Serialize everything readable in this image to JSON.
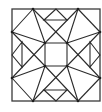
{
  "diagram": {
    "title": "",
    "stroke_color": "#2b2b2b",
    "background_color": "#ffffff",
    "frame": {
      "x": 12,
      "y": 9,
      "width": 88,
      "height": 92
    },
    "vertices": {
      "T1": [
        33,
        9
      ],
      "T2": [
        56,
        9
      ],
      "T3": [
        78,
        9
      ],
      "B1": [
        33,
        101
      ],
      "B2": [
        56,
        101
      ],
      "B3": [
        78,
        101
      ],
      "L1": [
        12,
        32
      ],
      "L2": [
        12,
        55
      ],
      "L3": [
        12,
        78
      ],
      "R1": [
        100,
        32
      ],
      "R2": [
        100,
        55
      ],
      "R3": [
        100,
        78
      ],
      "I1": [
        45,
        43
      ],
      "I2": [
        67,
        43
      ],
      "I3": [
        67,
        66
      ],
      "I4": [
        45,
        66
      ]
    },
    "dots": [
      "T1",
      "T3",
      "B1",
      "B3",
      "L1",
      "L3",
      "R1",
      "R3",
      "I1",
      "I2",
      "I3",
      "I4"
    ],
    "segments": [
      [
        "T1",
        "L1"
      ],
      [
        "T3",
        "R1"
      ],
      [
        "B1",
        "L3"
      ],
      [
        "B3",
        "R3"
      ],
      [
        "T1",
        "I1"
      ],
      [
        "T3",
        "I2"
      ],
      [
        "B1",
        "I4"
      ],
      [
        "B3",
        "I3"
      ],
      [
        "L1",
        "I1"
      ],
      [
        "R1",
        "I2"
      ],
      [
        "L3",
        "I4"
      ],
      [
        "R3",
        "I3"
      ],
      [
        "T1",
        "I2"
      ],
      [
        "T3",
        "I1"
      ],
      [
        "B1",
        "I3"
      ],
      [
        "B3",
        "I4"
      ],
      [
        "L1",
        "I4"
      ],
      [
        "L3",
        "I1"
      ],
      [
        "R1",
        "I3"
      ],
      [
        "R3",
        "I2"
      ],
      [
        "I1",
        "I2"
      ],
      [
        "I2",
        "I3"
      ],
      [
        "I3",
        "I4"
      ],
      [
        "I4",
        "I1"
      ]
    ],
    "triangles": [
      {
        "name": "top",
        "points": [
          [
            56,
            9
          ],
          [
            44,
            20
          ],
          [
            67,
            20
          ]
        ]
      },
      {
        "name": "bottom",
        "points": [
          [
            56,
            101
          ],
          [
            44,
            90
          ],
          [
            67,
            90
          ]
        ]
      },
      {
        "name": "left",
        "points": [
          [
            12,
            55
          ],
          [
            22,
            42
          ],
          [
            22,
            67
          ]
        ]
      },
      {
        "name": "right",
        "points": [
          [
            100,
            55
          ],
          [
            90,
            42
          ],
          [
            90,
            67
          ]
        ]
      }
    ]
  }
}
